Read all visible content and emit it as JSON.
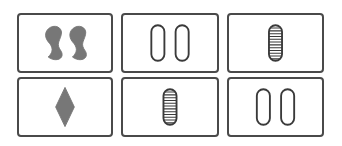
{
  "game": "set-card-board",
  "colors": {
    "ink": "#3a3a3a",
    "fill": "#777777",
    "border": "#4a4a4a"
  },
  "cards": [
    {
      "number": 2,
      "shape": "squiggle",
      "shading": "solid",
      "color": "gray"
    },
    {
      "number": 2,
      "shape": "oval",
      "shading": "open",
      "color": "black"
    },
    {
      "number": 1,
      "shape": "oval",
      "shading": "striped",
      "color": "black"
    },
    {
      "number": 1,
      "shape": "diamond",
      "shading": "solid",
      "color": "gray"
    },
    {
      "number": 1,
      "shape": "oval",
      "shading": "striped",
      "color": "black"
    },
    {
      "number": 2,
      "shape": "oval",
      "shading": "open",
      "color": "black"
    }
  ]
}
